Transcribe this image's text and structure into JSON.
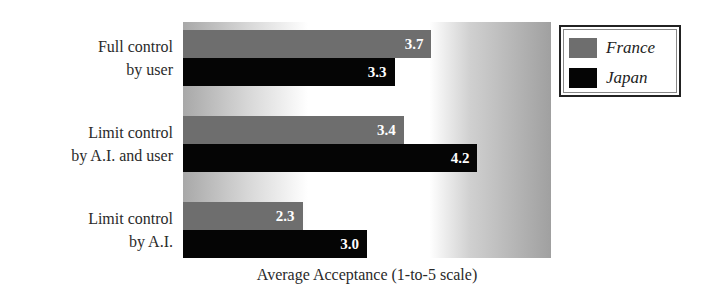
{
  "chart_data": {
    "type": "bar",
    "orientation": "horizontal",
    "title": "",
    "xlabel": "Average Acceptance (1-to-5 scale)",
    "ylabel": "",
    "xlim": [
      1,
      5
    ],
    "grid": false,
    "legend_position": "top-right (outside plot)",
    "categories": [
      "Full control by user",
      "Limit control by A.I. and user",
      "Limit control by A.I."
    ],
    "category_lines": [
      [
        "Full control",
        "by user"
      ],
      [
        "Limit control",
        "by A.I. and user"
      ],
      [
        "Limit control",
        "by A.I."
      ]
    ],
    "series": [
      {
        "name": "France",
        "color": "#6e6e6e",
        "values": [
          3.7,
          3.4,
          2.3
        ],
        "labels": [
          "3.7",
          "3.4",
          "2.3"
        ]
      },
      {
        "name": "Japan",
        "color": "#050505",
        "values": [
          3.3,
          4.2,
          3.0
        ],
        "labels": [
          "3.3",
          "4.2",
          "3.0"
        ]
      }
    ]
  }
}
